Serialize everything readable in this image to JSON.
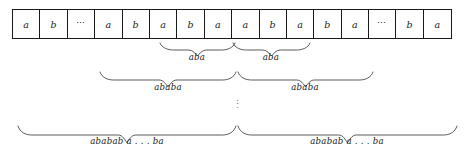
{
  "figure": {
    "tape": {
      "cells": [
        {
          "symbol": "a"
        },
        {
          "symbol": "b"
        },
        {
          "symbol": "⋯"
        },
        {
          "symbol": "a"
        },
        {
          "symbol": "b"
        },
        {
          "symbol": "a"
        },
        {
          "symbol": "b"
        },
        {
          "symbol": "a"
        },
        {
          "symbol": "a"
        },
        {
          "symbol": "b"
        },
        {
          "symbol": "a"
        },
        {
          "symbol": "b"
        },
        {
          "symbol": "a"
        },
        {
          "symbol": "⋯"
        },
        {
          "symbol": "b"
        },
        {
          "symbol": "a"
        }
      ]
    },
    "vertical_ellipsis": "⋮",
    "brace_rows": [
      {
        "name": "aba-row",
        "braces": [
          {
            "label": "aba",
            "x_start": 160,
            "x_end": 235,
            "label_x": 197
          },
          {
            "label": "aba",
            "x_start": 233,
            "x_end": 310,
            "label_x": 271
          }
        ]
      },
      {
        "name": "ababa-row",
        "braces": [
          {
            "label": "ababa",
            "x_start": 100,
            "x_end": 236,
            "label_x": 168
          },
          {
            "label": "ababa",
            "x_start": 238,
            "x_end": 373,
            "label_x": 305
          }
        ]
      },
      {
        "name": "ababab-ba-row",
        "braces": [
          {
            "label": "ababab a . . . ba",
            "x_start": 18,
            "x_end": 236,
            "label_x": 127
          },
          {
            "label": "ababab a . . . ba",
            "x_start": 238,
            "x_end": 457,
            "label_x": 347
          }
        ]
      }
    ],
    "colors": {
      "ink": "#1a1a1a",
      "brace_stroke": "#3d3d3d",
      "background": "#ffffff",
      "ellipsis": "#8a8a8a"
    }
  }
}
